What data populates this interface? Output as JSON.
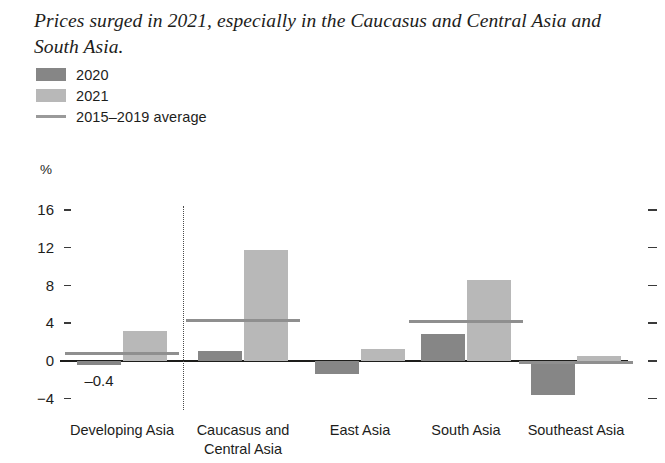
{
  "title": "Prices surged in 2021, especially in the Caucasus and Central Asia and South Asia.",
  "legend": {
    "items": [
      {
        "label": "2020",
        "type": "swatch",
        "color": "#868686"
      },
      {
        "label": "2021",
        "type": "swatch",
        "color": "#b8b8b8"
      },
      {
        "label": "2015–2019 average",
        "type": "line",
        "color": "#9a9a9a"
      }
    ]
  },
  "chart_data": {
    "type": "bar",
    "title": "Prices surged in 2021, especially in the Caucasus and Central Asia and South Asia.",
    "xlabel": "",
    "ylabel": "%",
    "unit_label": "%",
    "ylim": [
      -4,
      16
    ],
    "yticks": [
      16,
      12,
      8,
      4,
      0,
      -4
    ],
    "ytick_labels": [
      "16",
      "12",
      "8",
      "4",
      "0",
      "−4"
    ],
    "grid": false,
    "legend_position": "top-left",
    "categories": [
      "Developing Asia",
      "Caucasus and Central Asia",
      "East Asia",
      "South Asia",
      "Southeast Asia"
    ],
    "series": [
      {
        "name": "2020",
        "color": "#868686",
        "values": [
          -0.4,
          1.1,
          -1.4,
          2.9,
          -3.6
        ]
      },
      {
        "name": "2021",
        "color": "#b8b8b8",
        "values": [
          3.2,
          11.8,
          1.3,
          8.6,
          0.5
        ]
      },
      {
        "name": "2015–2019 average",
        "color": "#9a9a9a",
        "type": "marker-line",
        "values": [
          0.8,
          4.3,
          0.0,
          4.2,
          -0.2
        ]
      }
    ],
    "annotations": [
      {
        "text": "–0.4",
        "category": "Developing Asia",
        "series": "2020",
        "value": -0.4
      }
    ],
    "separator": {
      "after_category": "Developing Asia",
      "style": "dotted"
    }
  }
}
